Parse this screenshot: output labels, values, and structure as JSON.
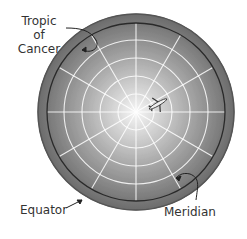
{
  "labels": {
    "tropic_line1": "Tropic of",
    "tropic_line2": "Cancer",
    "equator": "Equator",
    "meridian": "Meridian"
  },
  "icons": {
    "airplane": "airplane-icon"
  },
  "colors": {
    "globe_edge": "#6a6a6a",
    "globe_center": "#f4f4f4",
    "grid": "#ffffff",
    "circle_line": "#222222"
  }
}
